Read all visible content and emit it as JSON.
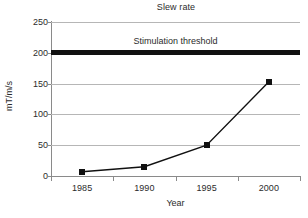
{
  "chart_data": {
    "type": "line",
    "title": "Slew rate",
    "xlabel": "Year",
    "ylabel": "mT/m/s",
    "categories": [
      "1985",
      "1990",
      "1995",
      "2000"
    ],
    "values": [
      7,
      15,
      50,
      153
    ],
    "series": [
      {
        "name": "Slew rate",
        "values": [
          7,
          15,
          50,
          153
        ],
        "marker": "filled-square",
        "color": "#111111"
      }
    ],
    "ylim": [
      0,
      250
    ],
    "yticks": [
      0,
      50,
      100,
      150,
      200,
      250
    ],
    "ytick_labels": [
      "0",
      "50",
      "100",
      "150",
      "200",
      "250"
    ],
    "grid": true,
    "legend": "none",
    "annotations": [
      {
        "name": "stimulation-threshold",
        "label": "Stimulation threshold",
        "value": 200,
        "style": "thick-horizontal-line",
        "color": "#111111"
      }
    ]
  }
}
